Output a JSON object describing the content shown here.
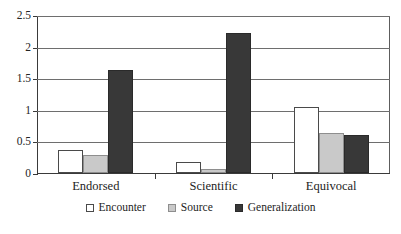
{
  "chart_data": {
    "type": "bar",
    "title": "",
    "subtitle": "",
    "xlabel": "",
    "ylabel": "",
    "categories": [
      "Endorsed",
      "Scientific",
      "Equivocal"
    ],
    "series": [
      {
        "name": "Encounter",
        "values": [
          0.36,
          0.17,
          1.05
        ],
        "color": "#ffffff"
      },
      {
        "name": "Source",
        "values": [
          0.28,
          0.07,
          0.63
        ],
        "color": "#c9c9c9"
      },
      {
        "name": "Generalization",
        "values": [
          1.63,
          2.22,
          0.6
        ],
        "color": "#383838"
      }
    ],
    "ylim": [
      0,
      2.5
    ],
    "yticks": [
      0,
      0.5,
      1,
      1.5,
      2,
      2.5
    ],
    "ytick_labels": [
      "0",
      "0.5",
      "1",
      "1.5",
      "2",
      "2.5"
    ],
    "grid": true,
    "grid_axis": "y",
    "legend": true,
    "legend_position": "bottom",
    "annotations": []
  },
  "colors": {
    "axis": "#3a3a3a",
    "grid": "#6e6e6e",
    "text": "#1d1d1d",
    "background": "#ffffff",
    "encounter": "#ffffff",
    "source": "#c9c9c9",
    "generalization": "#383838"
  }
}
